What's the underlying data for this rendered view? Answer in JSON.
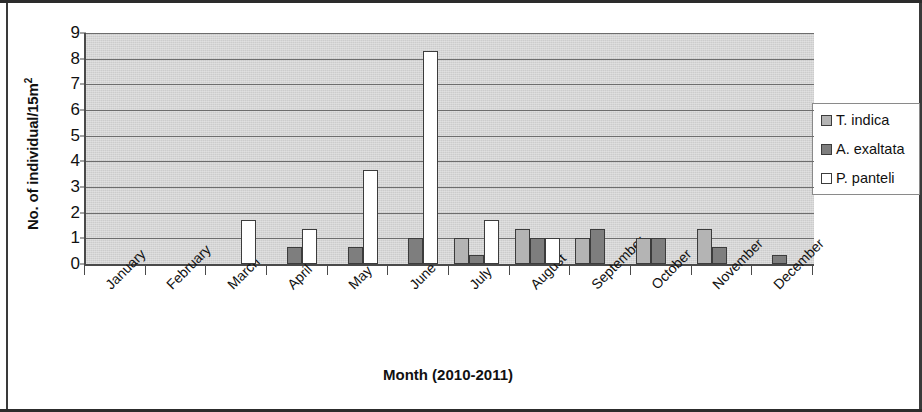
{
  "chart_data": {
    "type": "bar",
    "title": "",
    "xlabel": "Month (2010-2011)",
    "ylabel": "No. of individual/15m2",
    "ylabel_html": "No. of individual/15m",
    "ylabel_sup": "2",
    "ylim": [
      0,
      9
    ],
    "yticks": [
      0,
      1,
      2,
      3,
      4,
      5,
      6,
      7,
      8,
      9
    ],
    "grid": true,
    "grid_axis": "y",
    "legend_position": "right",
    "categories": [
      "January",
      "February",
      "March",
      "April",
      "May",
      "June",
      "July",
      "August",
      "September",
      "October",
      "November",
      "December"
    ],
    "series": [
      {
        "name": "T. indica",
        "color": "#b4b4b4",
        "values": [
          0,
          0,
          0,
          0,
          0,
          0,
          1.0,
          1.35,
          1.0,
          1.0,
          1.35,
          0
        ]
      },
      {
        "name": "A. exaltata",
        "color": "#7e7e7e",
        "values": [
          0,
          0,
          0,
          0.65,
          0.65,
          1.0,
          0.35,
          1.0,
          1.35,
          1.0,
          0.65,
          0.35
        ]
      },
      {
        "name": "P. panteli",
        "color": "#ffffff",
        "values": [
          0,
          0,
          1.7,
          1.35,
          3.65,
          8.3,
          1.7,
          1.0,
          0,
          0,
          0,
          0
        ]
      }
    ]
  },
  "legend": {
    "items": [
      {
        "label": "T. indica",
        "swatch": "light-grey"
      },
      {
        "label": "A. exaltata",
        "swatch": "dark-grey"
      },
      {
        "label": "P. panteli",
        "swatch": "white"
      }
    ]
  },
  "colors": {
    "plot_background": "#d5d5d5",
    "gridline": "#6d6d6d",
    "axis": "#4a4a4a",
    "text": "#111111",
    "series_t_indica": "#b4b4b4",
    "series_a_exaltata": "#7e7e7e",
    "series_p_panteli": "#ffffff"
  }
}
